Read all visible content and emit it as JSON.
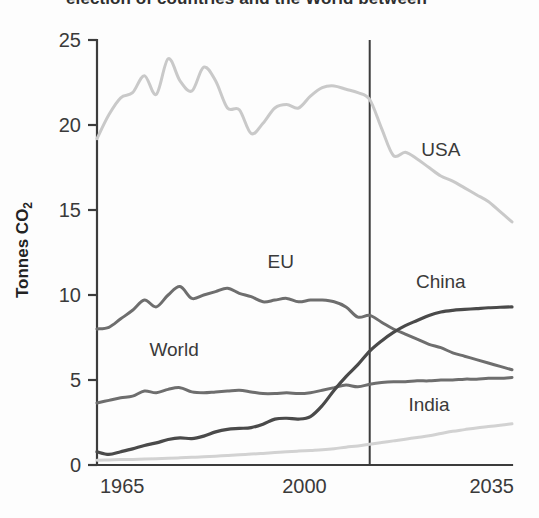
{
  "caption": {
    "partial_text": "election of countries and the World between"
  },
  "chart_data": {
    "type": "line",
    "title": "",
    "xlabel": "",
    "ylabel": "Tonnes CO2",
    "ylabel_main": "Tonnes CO",
    "ylabel_subscript": "2",
    "xlim": [
      1965,
      2035
    ],
    "ylim": [
      0,
      25
    ],
    "grid": false,
    "legend_position": "inline-labels",
    "x_ticks": [
      "1965",
      "2000",
      "2035"
    ],
    "x_tick_values": [
      1965,
      2000,
      2035
    ],
    "y_ticks": [
      "0",
      "5",
      "10",
      "15",
      "20",
      "25"
    ],
    "y_tick_values": [
      0,
      5,
      10,
      15,
      20,
      25
    ],
    "annotations": [
      {
        "label": "projection-divider",
        "x": 2011,
        "type": "vline"
      }
    ],
    "series": [
      {
        "name": "USA",
        "color": "#c9c9c9",
        "width": 3,
        "label_x": 2023,
        "label_y": 18.2,
        "x": [
          1965,
          1967,
          1969,
          1971,
          1973,
          1975,
          1977,
          1979,
          1981,
          1983,
          1985,
          1987,
          1989,
          1991,
          1993,
          1995,
          1997,
          1999,
          2001,
          2003,
          2005,
          2007,
          2009,
          2011,
          2013,
          2015,
          2017,
          2019,
          2021,
          2023,
          2025,
          2027,
          2029,
          2031,
          2033,
          2035
        ],
        "values": [
          19.2,
          20.6,
          21.6,
          21.9,
          22.9,
          21.8,
          23.9,
          22.6,
          22.0,
          23.4,
          22.6,
          21.0,
          20.9,
          19.5,
          20.1,
          21.0,
          21.2,
          21.0,
          21.7,
          22.2,
          22.3,
          22.1,
          21.9,
          21.5,
          19.8,
          18.2,
          18.4,
          18.0,
          17.5,
          17.0,
          16.7,
          16.3,
          15.9,
          15.5,
          14.9,
          14.3
        ]
      },
      {
        "name": "EU",
        "color": "#6e6e6e",
        "width": 3,
        "label_x": 1996,
        "label_y": 11.6,
        "x": [
          1965,
          1967,
          1969,
          1971,
          1973,
          1975,
          1977,
          1979,
          1981,
          1983,
          1985,
          1987,
          1989,
          1991,
          1993,
          1995,
          1997,
          1999,
          2001,
          2003,
          2005,
          2007,
          2009,
          2011,
          2013,
          2015,
          2017,
          2019,
          2021,
          2023,
          2025,
          2027,
          2029,
          2031,
          2033,
          2035
        ],
        "values": [
          8.0,
          8.1,
          8.6,
          9.1,
          9.7,
          9.3,
          10.0,
          10.5,
          9.8,
          10.0,
          10.2,
          10.4,
          10.1,
          9.9,
          9.6,
          9.7,
          9.8,
          9.6,
          9.7,
          9.7,
          9.6,
          9.3,
          8.7,
          8.8,
          8.4,
          8.0,
          7.7,
          7.4,
          7.1,
          6.9,
          6.6,
          6.4,
          6.2,
          6.0,
          5.8,
          5.6
        ]
      },
      {
        "name": "World",
        "color": "#6e6e6e",
        "width": 3,
        "label_x": 1978,
        "label_y": 6.4,
        "x": [
          1965,
          1967,
          1969,
          1971,
          1973,
          1975,
          1977,
          1979,
          1981,
          1983,
          1985,
          1987,
          1989,
          1991,
          1993,
          1995,
          1997,
          1999,
          2001,
          2003,
          2005,
          2007,
          2009,
          2011,
          2013,
          2015,
          2017,
          2019,
          2021,
          2023,
          2025,
          2027,
          2029,
          2031,
          2033,
          2035
        ],
        "values": [
          3.65,
          3.8,
          3.95,
          4.05,
          4.35,
          4.25,
          4.45,
          4.55,
          4.3,
          4.25,
          4.3,
          4.35,
          4.4,
          4.3,
          4.2,
          4.2,
          4.25,
          4.2,
          4.25,
          4.4,
          4.55,
          4.7,
          4.6,
          4.75,
          4.85,
          4.9,
          4.9,
          4.95,
          4.95,
          5.0,
          5.0,
          5.05,
          5.05,
          5.1,
          5.1,
          5.15
        ]
      },
      {
        "name": "China",
        "color": "#4a4a4a",
        "width": 3.2,
        "label_x": 2023,
        "label_y": 10.4,
        "x": [
          1965,
          1967,
          1969,
          1971,
          1973,
          1975,
          1977,
          1979,
          1981,
          1983,
          1985,
          1987,
          1989,
          1991,
          1993,
          1995,
          1997,
          1999,
          2001,
          2003,
          2005,
          2007,
          2009,
          2011,
          2013,
          2015,
          2017,
          2019,
          2021,
          2023,
          2025,
          2027,
          2029,
          2031,
          2033,
          2035
        ],
        "values": [
          0.78,
          0.62,
          0.78,
          0.95,
          1.15,
          1.3,
          1.5,
          1.6,
          1.55,
          1.7,
          1.95,
          2.1,
          2.15,
          2.2,
          2.4,
          2.7,
          2.75,
          2.7,
          2.85,
          3.5,
          4.4,
          5.2,
          5.9,
          6.7,
          7.3,
          7.8,
          8.2,
          8.5,
          8.8,
          9.0,
          9.1,
          9.15,
          9.2,
          9.25,
          9.28,
          9.3
        ]
      },
      {
        "name": "India",
        "color": "#d2d2d2",
        "width": 3,
        "label_x": 2021,
        "label_y": 3.2,
        "x": [
          1965,
          1967,
          1969,
          1971,
          1973,
          1975,
          1977,
          1979,
          1981,
          1983,
          1985,
          1987,
          1989,
          1991,
          1993,
          1995,
          1997,
          1999,
          2001,
          2003,
          2005,
          2007,
          2009,
          2011,
          2013,
          2015,
          2017,
          2019,
          2021,
          2023,
          2025,
          2027,
          2029,
          2031,
          2033,
          2035
        ],
        "values": [
          0.28,
          0.3,
          0.32,
          0.33,
          0.35,
          0.37,
          0.4,
          0.42,
          0.45,
          0.48,
          0.52,
          0.56,
          0.6,
          0.64,
          0.68,
          0.73,
          0.78,
          0.82,
          0.86,
          0.9,
          0.96,
          1.05,
          1.12,
          1.22,
          1.32,
          1.42,
          1.52,
          1.62,
          1.72,
          1.85,
          1.98,
          2.08,
          2.18,
          2.26,
          2.34,
          2.42
        ]
      }
    ]
  }
}
